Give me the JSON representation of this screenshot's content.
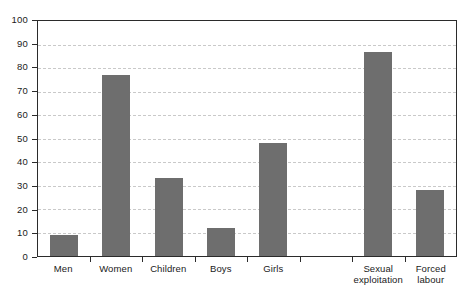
{
  "chart_data": {
    "type": "bar",
    "title": "",
    "subtitle": "",
    "xlabel": "",
    "ylabel": "",
    "ylim": [
      0,
      100
    ],
    "ytick_step": 10,
    "yticks": [
      100,
      90,
      80,
      70,
      60,
      50,
      40,
      30,
      20,
      10,
      0
    ],
    "ytick_labels": [
      "100",
      "90",
      "80",
      "70",
      "60",
      "50",
      "40",
      "30",
      "20",
      "10",
      "0"
    ],
    "grid": true,
    "grid_axis": "y",
    "grid_style": "dashed",
    "legend": false,
    "legend_position": "none",
    "bar_color": "#6e6e6e",
    "grid_color": "#c9c9c9",
    "frame_color": "#2b2b2b",
    "categories": [
      "Men",
      "Women",
      "Children",
      "Boys",
      "Girls",
      "",
      "Sexual exploitation",
      "Forced labour"
    ],
    "category_label_lines": [
      [
        "Men"
      ],
      [
        "Women"
      ],
      [
        "Children"
      ],
      [
        "Boys"
      ],
      [
        "Girls"
      ],
      [
        ""
      ],
      [
        "Sexual",
        "exploitation"
      ],
      [
        "Forced",
        "labour"
      ]
    ],
    "values": [
      9,
      77,
      33,
      12,
      48,
      null,
      87,
      28
    ],
    "series": [
      {
        "name": "",
        "values": [
          9,
          77,
          33,
          12,
          48,
          null,
          87,
          28
        ]
      }
    ]
  }
}
